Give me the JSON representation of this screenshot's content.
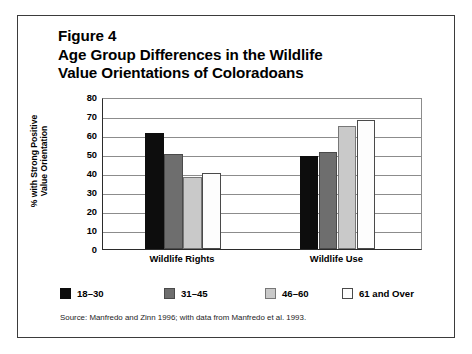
{
  "figure": {
    "title_lines": [
      "Figure 4",
      "Age Group Differences in the Wildlife",
      "Value Orientations of Coloradoans"
    ],
    "source_note": "Source: Manfredo and Zinn 1996; with data from Manfredo et al. 1993."
  },
  "chart_data": {
    "type": "bar",
    "title": "Figure 4 Age Group Differences in the Wildlife Value Orientations of Coloradoans",
    "xlabel": "",
    "ylabel": "% with Strong Positive Value Orientation",
    "ylabel_lines": [
      "% with Strong Positive",
      "Value Orientation"
    ],
    "categories": [
      "Wildlife Rights",
      "Wildlife Use"
    ],
    "series": [
      {
        "name": "18–30",
        "values": [
          61,
          49
        ],
        "color": "#0d0d0d",
        "border": "#0d0d0d"
      },
      {
        "name": "31–45",
        "values": [
          50,
          51
        ],
        "color": "#6e6e6e",
        "border": "#4a4a4a"
      },
      {
        "name": "46–60",
        "values": [
          38,
          65
        ],
        "color": "#c9c9c9",
        "border": "#777777"
      },
      {
        "name": "61 and Over",
        "values": [
          40,
          68
        ],
        "color": "#fdfdfd",
        "border": "#4a4a4a"
      }
    ],
    "ylim": [
      0,
      80
    ],
    "yticks": [
      0,
      10,
      20,
      30,
      40,
      50,
      60,
      70,
      80
    ],
    "ytick_labels": [
      "0",
      "10",
      "20",
      "30",
      "40",
      "50",
      "60",
      "70",
      "80"
    ],
    "grid": true,
    "legend_position": "bottom",
    "legend_entries": [
      "18–30",
      "31–45",
      "46–60",
      "61 and Over"
    ]
  }
}
